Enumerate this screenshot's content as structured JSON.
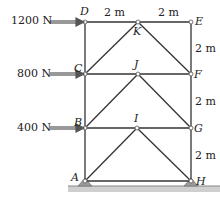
{
  "diagram": {
    "type": "truss",
    "forces": [
      {
        "label": "1200 N",
        "node": "D"
      },
      {
        "label": "800 N",
        "node": "C"
      },
      {
        "label": "400 N",
        "node": "B"
      }
    ],
    "nodes": {
      "A": "A",
      "B": "B",
      "C": "C",
      "D": "D",
      "E": "E",
      "F": "F",
      "G": "G",
      "H": "H",
      "I": "I",
      "J": "J",
      "K": "K"
    },
    "dimensions": {
      "top_left": "2 m",
      "top_right": "2 m",
      "right_EF": "2 m",
      "right_FG": "2 m",
      "right_GH": "2 m"
    },
    "colors": {
      "member": "#333333",
      "arrow": "#555555",
      "support": "#999999",
      "ground": "#bbbbbb"
    }
  }
}
